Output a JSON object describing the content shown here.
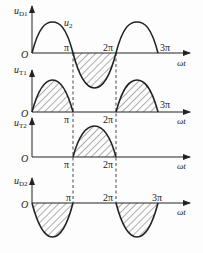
{
  "diagram": {
    "x_axis_label": "ωt",
    "origin_label": "O",
    "ticks": {
      "pi": "π",
      "two_pi": "2π",
      "three_pi": "3π"
    },
    "colors": {
      "line": "#222222",
      "background": "#fdfdfd"
    },
    "plots": [
      {
        "id": "uD1",
        "ylabel_main": "u",
        "ylabel_sub": "D1",
        "curve_label_main": "u",
        "curve_label_sub": "2",
        "shape": "sine over 0..3π with hatched negative half from π to 2π"
      },
      {
        "id": "uT1",
        "ylabel_main": "u",
        "ylabel_sub": "T1",
        "shape": "hatched positive halves 0..π and 2π..3π"
      },
      {
        "id": "uT2",
        "ylabel_main": "u",
        "ylabel_sub": "T2",
        "shape": "hatched positive half π..2π"
      },
      {
        "id": "uD2",
        "ylabel_main": "u",
        "ylabel_sub": "D2",
        "shape": "hatched negative halves 0..π and 2π..3π"
      }
    ]
  }
}
